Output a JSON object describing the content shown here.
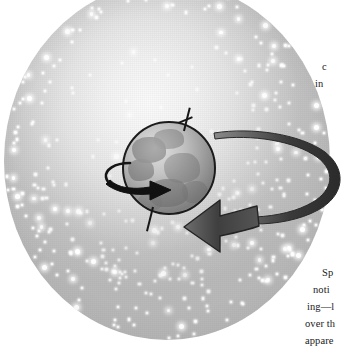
{
  "figure": {
    "kind": "celestial-sphere-diagram",
    "background_color": "#ffffff",
    "sphere": {
      "name": "celestial sphere",
      "fill_light": "#fbfbfb",
      "fill_dark": "#b9b9b9",
      "star_color": "#ffffff",
      "center_x": 167,
      "center_y": 161,
      "radius": 163
    },
    "earth": {
      "name": "earth globe",
      "outline_color": "#1b1b1b",
      "ocean_color": "#bdbdbd",
      "land_color": "#7e7e7e",
      "center_x": 169,
      "center_y": 168,
      "radius": 47
    },
    "axis": {
      "name": "rotation axis",
      "color": "#161616",
      "tilt_degrees": 14
    },
    "arrows": [
      {
        "id": "earth-rotation-arrow",
        "label": "",
        "color": "#111111",
        "direction": "eastward",
        "style": "small loop arrow encircling the globe, head pointing right"
      },
      {
        "id": "celestial-sphere-rotation-arrow",
        "label": "",
        "color": "#4a4a4a",
        "direction": "westward",
        "style": "large curved ribbon arrow sweeping around the sphere, head pointing left"
      }
    ]
  },
  "margin_text": {
    "top_lines": [
      "c",
      "in"
    ],
    "bottom_lines": [
      "Sp",
      "noti",
      "ing—l",
      "over th",
      "appare"
    ]
  }
}
